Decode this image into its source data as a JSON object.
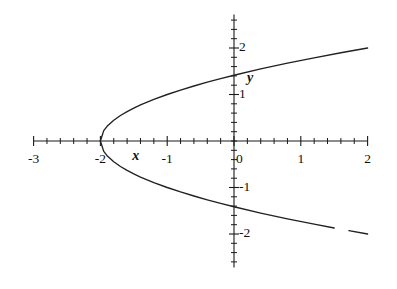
{
  "chart_data": {
    "type": "line",
    "title": "",
    "subtitle": "",
    "xlabel": "x",
    "ylabel": "y",
    "xlim": [
      -3,
      2
    ],
    "ylim": [
      -2.72,
      2.72
    ],
    "grid": false,
    "legend": null,
    "equation": "x = y^2 - 2",
    "vertex": [
      -2,
      0
    ],
    "x_ticks": [
      -3,
      -2,
      -1,
      0,
      1,
      2
    ],
    "x_tick_labels": [
      "-3",
      "-2",
      "-1",
      "0",
      "1",
      "2"
    ],
    "y_ticks": [
      -2,
      -1,
      1,
      2
    ],
    "y_tick_labels": [
      "-2",
      "-1",
      "1",
      "2"
    ],
    "minor_tick_step": 0.2,
    "series": [
      {
        "name": "upper-branch",
        "formula": "y = sqrt(x + 2)",
        "points": [
          [
            -2,
            0
          ],
          [
            -1.95,
            0.2236
          ],
          [
            -1.9,
            0.3162
          ],
          [
            -1.8,
            0.4472
          ],
          [
            -1.7,
            0.5477
          ],
          [
            -1.6,
            0.6325
          ],
          [
            -1.5,
            0.7071
          ],
          [
            -1.4,
            0.7746
          ],
          [
            -1.2,
            0.8944
          ],
          [
            -1.0,
            1.0
          ],
          [
            -0.8,
            1.0954
          ],
          [
            -0.6,
            1.1832
          ],
          [
            -0.4,
            1.2649
          ],
          [
            -0.2,
            1.3416
          ],
          [
            0,
            1.4142
          ],
          [
            0.4,
            1.5492
          ],
          [
            0.8,
            1.6733
          ],
          [
            1.2,
            1.7889
          ],
          [
            1.6,
            1.8974
          ],
          [
            2.0,
            2.0
          ]
        ]
      },
      {
        "name": "lower-branch",
        "formula": "y = -sqrt(x + 2)",
        "points": [
          [
            -2,
            0
          ],
          [
            -1.95,
            -0.2236
          ],
          [
            -1.9,
            -0.3162
          ],
          [
            -1.8,
            -0.4472
          ],
          [
            -1.7,
            -0.5477
          ],
          [
            -1.6,
            -0.6325
          ],
          [
            -1.5,
            -0.7071
          ],
          [
            -1.4,
            -0.7746
          ],
          [
            -1.2,
            -0.8944
          ],
          [
            -1.0,
            -1.0
          ],
          [
            -0.8,
            -1.0954
          ],
          [
            -0.6,
            -1.1832
          ],
          [
            -0.4,
            -1.2649
          ],
          [
            -0.2,
            -1.3416
          ],
          [
            0,
            -1.4142
          ],
          [
            0.4,
            -1.5492
          ],
          [
            0.8,
            -1.6733
          ],
          [
            1.2,
            -1.7889
          ],
          [
            1.5,
            -1.8708
          ]
        ]
      },
      {
        "name": "lower-branch-tail",
        "formula": "y = -sqrt(x + 2)",
        "points": [
          [
            1.72,
            -1.9287
          ],
          [
            2.0,
            -2.0
          ]
        ]
      }
    ],
    "annotations": [
      {
        "text": "x",
        "x": -1.47,
        "y": -0.4
      },
      {
        "text": "y",
        "x": 0.24,
        "y": 1.27
      }
    ],
    "colors": {
      "background": "#ffffff",
      "axis": "#1a1a1a",
      "curve": "#23201f",
      "text": "#111111"
    }
  }
}
